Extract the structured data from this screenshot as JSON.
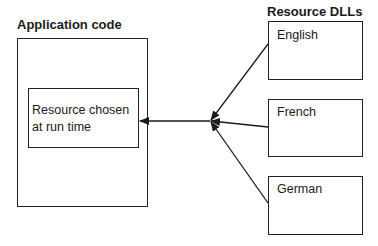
{
  "application": {
    "title": "Application code",
    "inner_box": {
      "line1": "Resource chosen",
      "line2": "at run time"
    }
  },
  "resources": {
    "title": "Resource DLLs",
    "dlls": [
      {
        "label": "English"
      },
      {
        "label": "French"
      },
      {
        "label": "German"
      }
    ]
  }
}
